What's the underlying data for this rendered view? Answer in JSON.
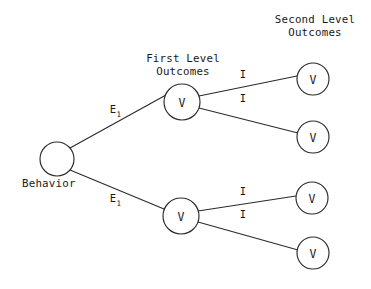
{
  "diagram": {
    "type": "expectancy-tree",
    "headings": [
      {
        "id": "first-level",
        "line1": "First Level",
        "line2": "Outcomes",
        "x": 183,
        "line1_y": 62,
        "line2_y": 75
      },
      {
        "id": "second-level",
        "line1": "Second Level",
        "line2": "Outcomes",
        "x": 315,
        "line1_y": 23,
        "line2_y": 36
      }
    ],
    "root": {
      "id": "behavior",
      "label": "",
      "caption": "Behavior",
      "caption_x": 22,
      "caption_y": 187,
      "cx": 57,
      "cy": 159,
      "r": 17
    },
    "first_level_nodes": [
      {
        "id": "first-level-node-top",
        "label": "V",
        "cx": 182,
        "cy": 102,
        "r": 18
      },
      {
        "id": "first-level-node-bottom",
        "label": "V",
        "cx": 181,
        "cy": 216,
        "r": 18
      }
    ],
    "second_level_nodes": [
      {
        "id": "second-level-node-1",
        "label": "V",
        "cx": 313,
        "cy": 79,
        "r": 16
      },
      {
        "id": "second-level-node-2",
        "label": "V",
        "cx": 313,
        "cy": 137,
        "r": 16
      },
      {
        "id": "second-level-node-3",
        "label": "V",
        "cx": 312,
        "cy": 198,
        "r": 16
      },
      {
        "id": "second-level-node-4",
        "label": "V",
        "cx": 313,
        "cy": 253,
        "r": 16
      }
    ],
    "edges": [
      {
        "id": "edge-behavior-to-first-top",
        "from": "behavior",
        "to": "first-level-node-top",
        "x1": 70,
        "y1": 148,
        "x2": 166,
        "y2": 95,
        "label": "E",
        "subscript": "1",
        "label_x": 113,
        "label_y": 113
      },
      {
        "id": "edge-behavior-to-first-bottom",
        "from": "behavior",
        "to": "first-level-node-bottom",
        "x1": 70,
        "y1": 170,
        "x2": 164,
        "y2": 209,
        "label": "E",
        "subscript": "1",
        "label_x": 113,
        "label_y": 202
      },
      {
        "id": "edge-first-top-to-second-1",
        "from": "first-level-node-top",
        "to": "second-level-node-1",
        "x1": 199,
        "y1": 96,
        "x2": 297,
        "y2": 76,
        "label": "I",
        "subscript": "",
        "label_x": 243,
        "label_y": 78
      },
      {
        "id": "edge-first-top-to-second-2",
        "from": "first-level-node-top",
        "to": "second-level-node-2",
        "x1": 199,
        "y1": 108,
        "x2": 298,
        "y2": 133,
        "label": "I",
        "subscript": "",
        "label_x": 243,
        "label_y": 102
      },
      {
        "id": "edge-first-bottom-to-second-3",
        "from": "first-level-node-bottom",
        "to": "second-level-node-3",
        "x1": 198,
        "y1": 211,
        "x2": 296,
        "y2": 196,
        "label": "I",
        "subscript": "",
        "label_x": 243,
        "label_y": 195
      },
      {
        "id": "edge-first-bottom-to-second-4",
        "from": "first-level-node-bottom",
        "to": "second-level-node-4",
        "x1": 198,
        "y1": 222,
        "x2": 298,
        "y2": 250,
        "label": "I",
        "subscript": "",
        "label_x": 243,
        "label_y": 218
      }
    ],
    "colors": {
      "background": "#ffffff",
      "stroke": "#2b2b2b",
      "text": "#1a1a1a"
    }
  }
}
